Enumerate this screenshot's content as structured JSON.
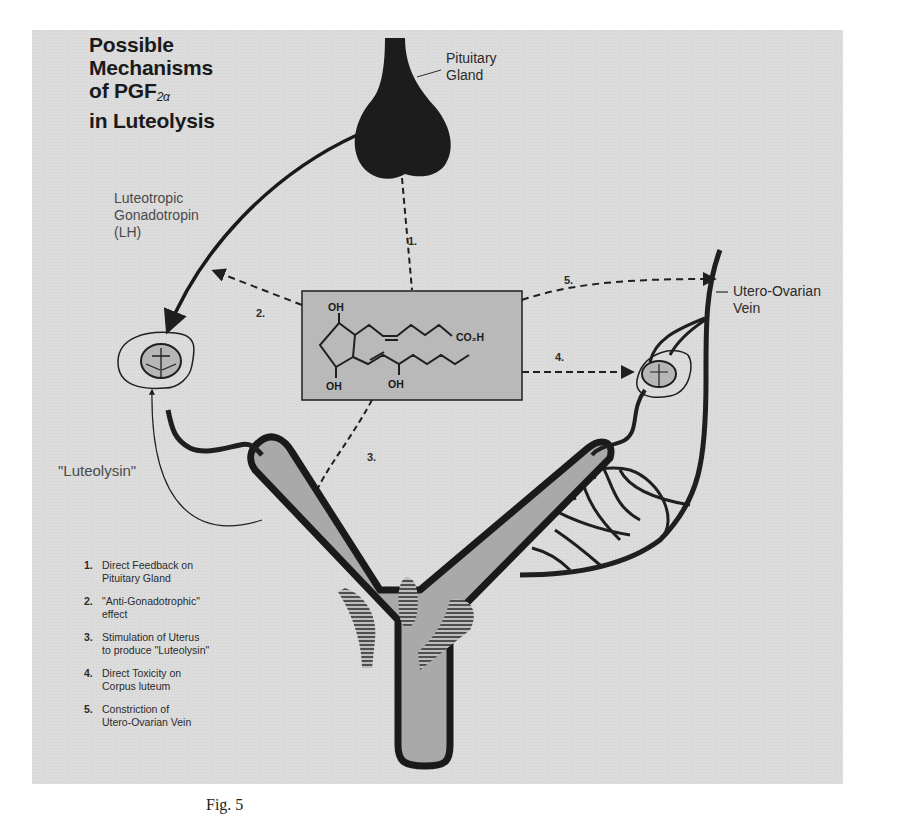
{
  "figure": {
    "title_lines": [
      "Possible",
      "Mechanisms",
      "of PGF",
      "in Luteolysis"
    ],
    "title_subscript": "2α",
    "caption": "Fig. 5"
  },
  "labels": {
    "pituitary_line1": "Pituitary",
    "pituitary_line2": "Gland",
    "lh_line1": "Luteotropic",
    "lh_line2": "Gonadotropin",
    "lh_line3": "(LH)",
    "vein_line1": "Utero-Ovarian",
    "vein_line2": "Vein",
    "luteolysin": "\"Luteolysin\""
  },
  "arrow_numbers": [
    "1.",
    "2.",
    "3.",
    "4.",
    "5."
  ],
  "chemical_structure": {
    "name": "PGF2α",
    "groups": [
      "OH",
      "OH",
      "OH",
      "CO₂H"
    ]
  },
  "legend": [
    {
      "number": "1.",
      "line1": "Direct Feedback on",
      "line2": "Pituitary Gland"
    },
    {
      "number": "2.",
      "line1": "\"Anti-Gonadotrophic\"",
      "line2": "effect"
    },
    {
      "number": "3.",
      "line1": "Stimulation of Uterus",
      "line2": "to produce \"Luteolysin\""
    },
    {
      "number": "4.",
      "line1": "Direct Toxicity on",
      "line2": "Corpus luteum"
    },
    {
      "number": "5.",
      "line1": "Constriction of",
      "line2": "Utero-Ovarian Vein"
    }
  ],
  "colors": {
    "panel": "#dcdcdc",
    "ink": "#1f1f1f",
    "organ_fill": "#a9a9a9",
    "chem_box": "#b9b9b9"
  }
}
